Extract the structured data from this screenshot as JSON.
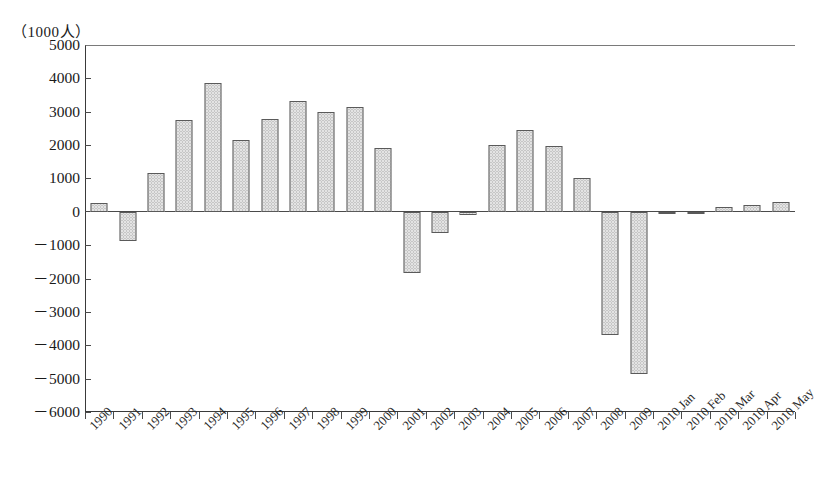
{
  "chart_data": {
    "type": "bar",
    "title": "",
    "subtitle": "",
    "xlabel": "",
    "ylabel": "（1000人）",
    "unit_caption": "（1000人）",
    "grid": false,
    "legend": null,
    "ylim": [
      -6000,
      5000
    ],
    "ytick_step": 1000,
    "yticks": [
      5000,
      4000,
      3000,
      2000,
      1000,
      0,
      -1000,
      -2000,
      -3000,
      -4000,
      -5000,
      -6000
    ],
    "ytick_labels": [
      "5000",
      "4000",
      "3000",
      "2000",
      "1000",
      "0",
      "－1000",
      "－2000",
      "－3000",
      "－4000",
      "－5000",
      "－6000"
    ],
    "categories": [
      "1990",
      "1991",
      "1992",
      "1993",
      "1994",
      "1995",
      "1996",
      "1997",
      "1998",
      "1999",
      "2000",
      "2001",
      "2002",
      "2003",
      "2004",
      "2005",
      "2006",
      "2007",
      "2008",
      "2009",
      "2010 Jan",
      "2010 Feb",
      "2010 Mar",
      "2010 Apr",
      "2010 May"
    ],
    "values": [
      270,
      -870,
      1150,
      2760,
      3860,
      2140,
      2780,
      3330,
      3000,
      3140,
      1920,
      -1840,
      -630,
      -90,
      2000,
      2440,
      1980,
      1010,
      -3690,
      -4860,
      -40,
      -60,
      150,
      200,
      280
    ],
    "series": [
      {
        "name": "",
        "values": [
          270,
          -870,
          1150,
          2760,
          3860,
          2140,
          2780,
          3330,
          3000,
          3140,
          1920,
          -1840,
          -630,
          -90,
          2000,
          2440,
          1980,
          1010,
          -3690,
          -4860,
          -40,
          -60,
          150,
          200,
          280
        ]
      }
    ],
    "bar_fill": "#e3e3e3",
    "bar_edge": "#5a5a5a",
    "axis_color": "#4a4a4a"
  }
}
